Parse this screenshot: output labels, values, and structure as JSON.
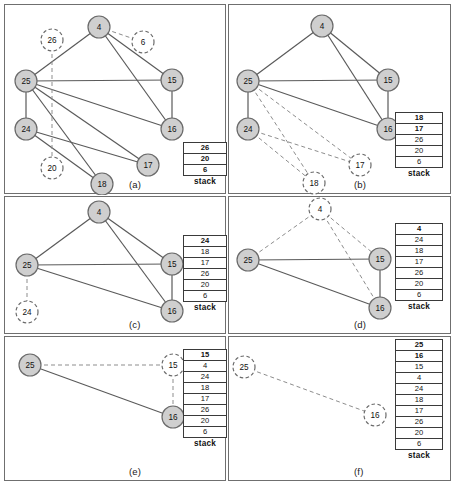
{
  "figure": {
    "grid": {
      "cols": 2,
      "rows": 3
    }
  },
  "stack_caption": "stack",
  "panels": [
    {
      "id": "a",
      "label": "(a)",
      "box": {
        "x": 4,
        "y": 4,
        "w": 222,
        "h": 190
      },
      "stack": {
        "x": 178,
        "y": 137,
        "w": 44,
        "values": [
          "26",
          "20",
          "6"
        ],
        "bold_count": 3
      },
      "nodes": [
        {
          "name": "25",
          "x": 21,
          "y": 76,
          "r": 11,
          "state": "visited"
        },
        {
          "name": "4",
          "x": 94,
          "y": 22,
          "r": 11,
          "state": "visited"
        },
        {
          "name": "15",
          "x": 167,
          "y": 75,
          "r": 11,
          "state": "visited"
        },
        {
          "name": "16",
          "x": 167,
          "y": 124,
          "r": 11,
          "state": "visited"
        },
        {
          "name": "24",
          "x": 21,
          "y": 124,
          "r": 11,
          "state": "visited"
        },
        {
          "name": "17",
          "x": 143,
          "y": 160,
          "r": 11,
          "state": "visited"
        },
        {
          "name": "18",
          "x": 97,
          "y": 179,
          "r": 11,
          "state": "visited"
        },
        {
          "name": "26",
          "x": 47,
          "y": 35,
          "r": 11,
          "state": "pending"
        },
        {
          "name": "6",
          "x": 138,
          "y": 37,
          "r": 11,
          "state": "pending"
        },
        {
          "name": "20",
          "x": 47,
          "y": 163,
          "r": 11,
          "state": "pending"
        }
      ],
      "edges": [
        {
          "from": "25",
          "to": "4",
          "style": "solid"
        },
        {
          "from": "4",
          "to": "15",
          "style": "solid"
        },
        {
          "from": "4",
          "to": "16",
          "style": "solid"
        },
        {
          "from": "4",
          "to": "6",
          "style": "dashed"
        },
        {
          "from": "25",
          "to": "15",
          "style": "solid"
        },
        {
          "from": "25",
          "to": "16",
          "style": "solid"
        },
        {
          "from": "15",
          "to": "16",
          "style": "solid"
        },
        {
          "from": "25",
          "to": "24",
          "style": "solid"
        },
        {
          "from": "25",
          "to": "17",
          "style": "solid"
        },
        {
          "from": "25",
          "to": "18",
          "style": "solid"
        },
        {
          "from": "24",
          "to": "17",
          "style": "solid"
        },
        {
          "from": "24",
          "to": "18",
          "style": "solid"
        },
        {
          "from": "26",
          "to": "20",
          "style": "dashed"
        }
      ]
    },
    {
      "id": "b",
      "label": "(b)",
      "box": {
        "x": 228,
        "y": 4,
        "w": 223,
        "h": 190
      },
      "stack": {
        "x": 166,
        "y": 107,
        "w": 48,
        "values": [
          "18",
          "17",
          "26",
          "20",
          "6"
        ],
        "bold_count": 2
      },
      "nodes": [
        {
          "name": "25",
          "x": 19,
          "y": 76,
          "r": 11,
          "state": "visited"
        },
        {
          "name": "4",
          "x": 93,
          "y": 21,
          "r": 11,
          "state": "visited"
        },
        {
          "name": "15",
          "x": 159,
          "y": 75,
          "r": 11,
          "state": "visited"
        },
        {
          "name": "16",
          "x": 159,
          "y": 124,
          "r": 11,
          "state": "visited"
        },
        {
          "name": "24",
          "x": 19,
          "y": 124,
          "r": 11,
          "state": "visited"
        },
        {
          "name": "17",
          "x": 131,
          "y": 160,
          "r": 11,
          "state": "pending"
        },
        {
          "name": "18",
          "x": 85,
          "y": 178,
          "r": 11,
          "state": "pending"
        }
      ],
      "edges": [
        {
          "from": "25",
          "to": "4",
          "style": "solid"
        },
        {
          "from": "4",
          "to": "15",
          "style": "solid"
        },
        {
          "from": "4",
          "to": "16",
          "style": "solid"
        },
        {
          "from": "25",
          "to": "15",
          "style": "solid"
        },
        {
          "from": "25",
          "to": "16",
          "style": "solid"
        },
        {
          "from": "15",
          "to": "16",
          "style": "solid"
        },
        {
          "from": "25",
          "to": "24",
          "style": "solid"
        },
        {
          "from": "25",
          "to": "17",
          "style": "dashed"
        },
        {
          "from": "25",
          "to": "18",
          "style": "dashed"
        },
        {
          "from": "24",
          "to": "17",
          "style": "dashed"
        },
        {
          "from": "24",
          "to": "18",
          "style": "dashed"
        }
      ]
    },
    {
      "id": "c",
      "label": "(c)",
      "box": {
        "x": 4,
        "y": 196,
        "w": 222,
        "h": 138
      },
      "stack": {
        "x": 178,
        "y": 38,
        "w": 44,
        "values": [
          "24",
          "18",
          "17",
          "26",
          "20",
          "6"
        ],
        "bold_count": 1
      },
      "nodes": [
        {
          "name": "25",
          "x": 22,
          "y": 68,
          "r": 11,
          "state": "visited"
        },
        {
          "name": "4",
          "x": 94,
          "y": 15,
          "r": 11,
          "state": "visited"
        },
        {
          "name": "15",
          "x": 167,
          "y": 67,
          "r": 11,
          "state": "visited"
        },
        {
          "name": "16",
          "x": 167,
          "y": 114,
          "r": 11,
          "state": "visited"
        },
        {
          "name": "24",
          "x": 22,
          "y": 115,
          "r": 11,
          "state": "pending"
        }
      ],
      "edges": [
        {
          "from": "25",
          "to": "4",
          "style": "solid"
        },
        {
          "from": "4",
          "to": "15",
          "style": "solid"
        },
        {
          "from": "4",
          "to": "16",
          "style": "solid"
        },
        {
          "from": "25",
          "to": "15",
          "style": "solid"
        },
        {
          "from": "25",
          "to": "16",
          "style": "solid"
        },
        {
          "from": "15",
          "to": "16",
          "style": "solid"
        },
        {
          "from": "25",
          "to": "24",
          "style": "dashed"
        }
      ]
    },
    {
      "id": "d",
      "label": "(d)",
      "box": {
        "x": 228,
        "y": 196,
        "w": 223,
        "h": 138
      },
      "stack": {
        "x": 166,
        "y": 26,
        "w": 48,
        "values": [
          "4",
          "24",
          "18",
          "17",
          "26",
          "20",
          "6"
        ],
        "bold_count": 1
      },
      "nodes": [
        {
          "name": "25",
          "x": 19,
          "y": 63,
          "r": 11,
          "state": "visited"
        },
        {
          "name": "4",
          "x": 91,
          "y": 12,
          "r": 11,
          "state": "pending"
        },
        {
          "name": "15",
          "x": 151,
          "y": 62,
          "r": 11,
          "state": "visited"
        },
        {
          "name": "16",
          "x": 151,
          "y": 111,
          "r": 11,
          "state": "visited"
        }
      ],
      "edges": [
        {
          "from": "25",
          "to": "4",
          "style": "dashed"
        },
        {
          "from": "4",
          "to": "15",
          "style": "dashed"
        },
        {
          "from": "4",
          "to": "16",
          "style": "dashed"
        },
        {
          "from": "25",
          "to": "15",
          "style": "solid"
        },
        {
          "from": "25",
          "to": "16",
          "style": "solid"
        },
        {
          "from": "15",
          "to": "16",
          "style": "solid"
        }
      ]
    },
    {
      "id": "e",
      "label": "(e)",
      "box": {
        "x": 4,
        "y": 336,
        "w": 222,
        "h": 145
      },
      "stack": {
        "x": 178,
        "y": 12,
        "w": 44,
        "values": [
          "15",
          "4",
          "24",
          "18",
          "17",
          "26",
          "20",
          "6"
        ],
        "bold_count": 1
      },
      "nodes": [
        {
          "name": "25",
          "x": 25,
          "y": 28,
          "r": 11,
          "state": "visited"
        },
        {
          "name": "15",
          "x": 168,
          "y": 28,
          "r": 11,
          "state": "pending"
        },
        {
          "name": "16",
          "x": 168,
          "y": 80,
          "r": 11,
          "state": "visited"
        }
      ],
      "edges": [
        {
          "from": "25",
          "to": "15",
          "style": "dashed"
        },
        {
          "from": "25",
          "to": "16",
          "style": "solid"
        },
        {
          "from": "15",
          "to": "16",
          "style": "dashed"
        }
      ]
    },
    {
      "id": "f",
      "label": "(f)",
      "box": {
        "x": 228,
        "y": 336,
        "w": 223,
        "h": 145
      },
      "stack": {
        "x": 166,
        "y": 2,
        "w": 48,
        "values": [
          "25",
          "16",
          "15",
          "4",
          "24",
          "18",
          "17",
          "26",
          "20",
          "6"
        ],
        "bold_count": 2
      },
      "nodes": [
        {
          "name": "25",
          "x": 15,
          "y": 30,
          "r": 11,
          "state": "pending"
        },
        {
          "name": "16",
          "x": 146,
          "y": 78,
          "r": 11,
          "state": "pending"
        }
      ],
      "edges": [
        {
          "from": "25",
          "to": "16",
          "style": "dashed"
        }
      ]
    }
  ],
  "colors": {
    "node_fill_visited": "#cfcfcf",
    "node_fill_pending": "#ffffff",
    "node_stroke": "#6a6a6a",
    "edge_solid": "#5a5a5a",
    "edge_dashed": "#8d8d8d",
    "frame": "#6f6f6f",
    "text": "#111111"
  }
}
